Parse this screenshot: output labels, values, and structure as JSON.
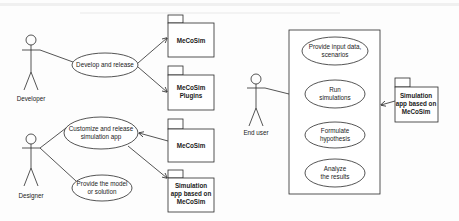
{
  "diagram": {
    "type": "UML use case diagram",
    "actors": [
      {
        "id": "developer",
        "label": "Developer"
      },
      {
        "id": "designer",
        "label": "Designer"
      },
      {
        "id": "end_user",
        "label": "End user"
      }
    ],
    "use_cases": [
      {
        "id": "develop_release",
        "line1": "Develop and release",
        "line2": ""
      },
      {
        "id": "customize_release",
        "line1": "Customize and release",
        "line2": "simulation app"
      },
      {
        "id": "provide_model",
        "line1": "Provide the model",
        "line2": "or solution"
      },
      {
        "id": "provide_input",
        "line1": "Provide input data,",
        "line2": "scenarios"
      },
      {
        "id": "run_sim",
        "line1": "Run",
        "line2": "simulations"
      },
      {
        "id": "formulate",
        "line1": "Formulate",
        "line2": "hypothesis"
      },
      {
        "id": "analyze",
        "line1": "Analyze",
        "line2": "the results"
      }
    ],
    "packages": [
      {
        "id": "pkg_mecosim_1",
        "lines": [
          "MeCoSim"
        ]
      },
      {
        "id": "pkg_plugins",
        "lines": [
          "MeCoSim",
          "Plugins"
        ]
      },
      {
        "id": "pkg_mecosim_2",
        "lines": [
          "MeCoSim"
        ]
      },
      {
        "id": "pkg_simapp_1",
        "lines": [
          "Simulation",
          "app based on",
          "MeCoSim"
        ]
      },
      {
        "id": "pkg_simapp_2",
        "lines": [
          "Simulation",
          "app based on",
          "MeCoSim"
        ]
      }
    ],
    "relations": [
      {
        "from": "developer",
        "to": "develop_release",
        "kind": "association"
      },
      {
        "from": "develop_release",
        "to": "pkg_mecosim_1",
        "kind": "arrow"
      },
      {
        "from": "develop_release",
        "to": "pkg_plugins",
        "kind": "arrow"
      },
      {
        "from": "designer",
        "to": "customize_release",
        "kind": "association"
      },
      {
        "from": "designer",
        "to": "provide_model",
        "kind": "association"
      },
      {
        "from": "pkg_mecosim_2",
        "to": "customize_release",
        "kind": "arrow"
      },
      {
        "from": "customize_release",
        "to": "pkg_simapp_1",
        "kind": "arrow"
      },
      {
        "from": "end_user",
        "to": "system_boundary",
        "kind": "association"
      },
      {
        "from": "pkg_simapp_2",
        "to": "system_boundary",
        "kind": "arrow"
      }
    ],
    "colors": {
      "line": "#2a2a2a",
      "text": "#1a1a1a",
      "background": "#fdfdfd"
    }
  }
}
